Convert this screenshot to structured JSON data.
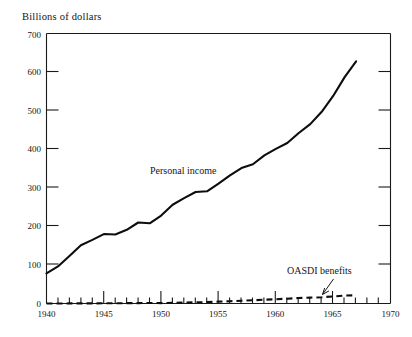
{
  "chart_data": {
    "type": "line",
    "title": "",
    "ylabel": "Billions of dollars",
    "xlabel": "",
    "xlim": [
      1940,
      1970
    ],
    "ylim": [
      0,
      700
    ],
    "grid": false,
    "legend_position": "inline-annotations",
    "y_ticks": [
      0,
      100,
      200,
      300,
      400,
      500,
      600,
      700
    ],
    "y_tick_labels": [
      "0",
      "100",
      "200",
      "300",
      "400",
      "500",
      "600",
      "700"
    ],
    "x_ticks": [
      1940,
      1945,
      1950,
      1955,
      1960,
      1965,
      1970
    ],
    "x_tick_labels": [
      "1940",
      "1945",
      "1950",
      "1955",
      "1960",
      "1965",
      "1970"
    ],
    "x_minor_tick_interval": 1,
    "x": [
      1940,
      1941,
      1942,
      1943,
      1944,
      1945,
      1946,
      1947,
      1948,
      1949,
      1950,
      1951,
      1952,
      1953,
      1954,
      1955,
      1956,
      1957,
      1958,
      1959,
      1960,
      1961,
      1962,
      1963,
      1964,
      1965,
      1966,
      1967
    ],
    "series": [
      {
        "name": "Personal income",
        "style": "solid",
        "values": [
          78,
          96,
          123,
          151,
          165,
          180,
          179,
          191,
          210,
          208,
          228,
          256,
          273,
          289,
          291,
          311,
          332,
          351,
          361,
          384,
          401,
          416,
          442,
          465,
          497,
          538,
          587,
          628
        ]
      },
      {
        "name": "OASDI benefits",
        "style": "dashed",
        "values": [
          0.04,
          0.1,
          0.2,
          0.3,
          0.4,
          0.5,
          0.7,
          0.9,
          1.0,
          1.3,
          1.0,
          1.9,
          2.2,
          3.0,
          3.7,
          4.9,
          5.7,
          7.3,
          8.3,
          9.8,
          11.1,
          12.5,
          14.2,
          15.2,
          16.2,
          18.3,
          20.8,
          21.4
        ]
      }
    ],
    "annotations": [
      {
        "text": "Personal income",
        "series": "Personal income",
        "x": 1951.5,
        "y": 330
      },
      {
        "text": "OASDI benefits",
        "series": "OASDI benefits",
        "x": 1963.5,
        "y": 95,
        "arrow": true,
        "arrow_target_x": 1964,
        "arrow_target_y": 20
      }
    ]
  },
  "colors": {
    "ink": "#0d0d0d",
    "axis": "#1a1a1a",
    "background": "#ffffff"
  }
}
